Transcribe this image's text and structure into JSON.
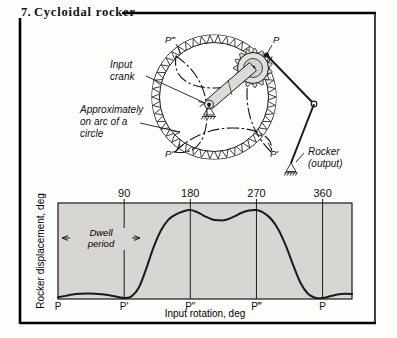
{
  "figure": {
    "number": "7.",
    "title": "Cycloidal rocker"
  },
  "mechanism": {
    "labels": {
      "p": "P",
      "p_prime": "P'",
      "p_double_prime": "P\"",
      "p_triple_prime": "P‴",
      "input_crank": "Input\ncrank",
      "input_crank_line1": "Input",
      "input_crank_line2": "crank",
      "approx_line1": "Approximately",
      "approx_line2": "on arc of a",
      "approx_line3": "circle",
      "rocker_line1": "Rocker",
      "rocker_line2": "(output)"
    },
    "gear_teeth": 46
  },
  "chart_data": {
    "type": "line",
    "title": "",
    "xlabel": "Input rotation, deg",
    "ylabel": "Rocker displacement, deg",
    "xlim": [
      0,
      400
    ],
    "ylim": [
      0,
      1.08
    ],
    "grid": false,
    "axis_position": "top",
    "xticks": [
      90,
      180,
      270,
      360
    ],
    "xticklabels": [
      "90",
      "180",
      "270",
      "360"
    ],
    "bottom_labels": [
      {
        "x": 0,
        "label": "P"
      },
      {
        "x": 90,
        "label": "P'"
      },
      {
        "x": 180,
        "label": "P\""
      },
      {
        "x": 270,
        "label": "P‴"
      },
      {
        "x": 360,
        "label": "P"
      }
    ],
    "annotations": [
      {
        "text_line1": "Dwell",
        "text_line2": "period",
        "from_x": 0,
        "to_x": 90,
        "kind": "double-arrow"
      }
    ],
    "series": [
      {
        "name": "Rocker displacement",
        "x": [
          0,
          10,
          20,
          30,
          40,
          50,
          60,
          70,
          80,
          90,
          100,
          110,
          120,
          130,
          140,
          150,
          160,
          170,
          180,
          190,
          200,
          210,
          220,
          225,
          230,
          240,
          250,
          260,
          270,
          280,
          290,
          300,
          310,
          320,
          330,
          340,
          350,
          360,
          370,
          380,
          390,
          400
        ],
        "y": [
          0.02,
          0.035,
          0.05,
          0.058,
          0.062,
          0.06,
          0.053,
          0.042,
          0.026,
          0.01,
          0.03,
          0.13,
          0.34,
          0.58,
          0.77,
          0.89,
          0.95,
          0.985,
          1.0,
          0.975,
          0.93,
          0.895,
          0.885,
          0.885,
          0.895,
          0.93,
          0.97,
          0.995,
          1.0,
          0.97,
          0.9,
          0.78,
          0.6,
          0.38,
          0.18,
          0.06,
          0.015,
          0.01,
          0.03,
          0.05,
          0.06,
          0.055
        ]
      }
    ]
  },
  "colors": {
    "ink": "#111111",
    "plot_fill": "#d8d6d2",
    "frame": "#000000"
  }
}
